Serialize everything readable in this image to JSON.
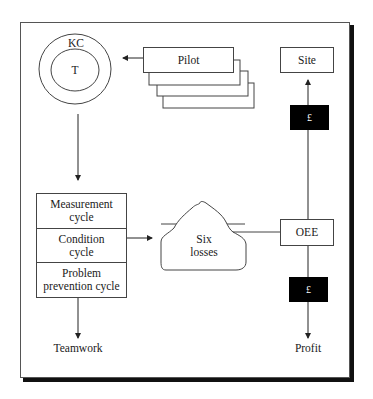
{
  "diagram": {
    "nodes": {
      "kc_outer": {
        "label": "KC"
      },
      "t_inner": {
        "label": "T"
      },
      "pilot": {
        "label": "Pilot",
        "stack_count": 4
      },
      "site": {
        "label": "Site"
      },
      "pound_upper": {
        "label": "£"
      },
      "pound_lower": {
        "label": "£"
      },
      "oee": {
        "label": "OEE"
      },
      "six_losses": {
        "label_line1": "Six",
        "label_line2": "losses",
        "shape": "iceberg"
      },
      "teamwork": {
        "label": "Teamwork"
      },
      "profit": {
        "label": "Profit"
      }
    },
    "cycles": [
      {
        "label": "Measurement\ncycle"
      },
      {
        "label": "Condition\ncycle"
      },
      {
        "label": "Problem\nprevention cycle"
      }
    ],
    "edges": [
      {
        "from": "pilot",
        "to": "kc_outer",
        "type": "arrow"
      },
      {
        "from": "kc_outer",
        "to": "cycles",
        "type": "arrow"
      },
      {
        "from": "cycles.condition",
        "to": "six_losses",
        "type": "arrow"
      },
      {
        "from": "six_losses",
        "to": "oee",
        "type": "line"
      },
      {
        "from": "oee",
        "to": "site",
        "type": "arrow",
        "via": "pound_upper"
      },
      {
        "from": "oee",
        "to": "profit",
        "type": "arrow",
        "via": "pound_lower"
      },
      {
        "from": "cycles",
        "to": "teamwork",
        "type": "arrow"
      }
    ],
    "colors": {
      "line": "#444444",
      "pound_box": "#000000",
      "frame_shadow": "#111111"
    }
  }
}
